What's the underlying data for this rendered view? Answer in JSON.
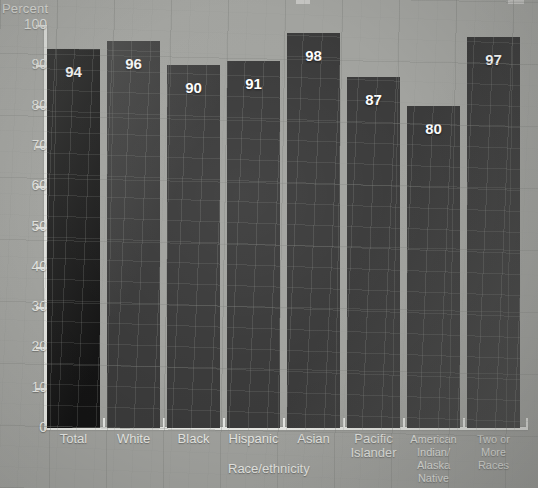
{
  "chart_data": {
    "type": "bar",
    "title": "",
    "xlabel": "Race/ethnicity",
    "ylabel": "Percent",
    "ylim": [
      0,
      100
    ],
    "ytick_labels": [
      "100",
      "90",
      "80",
      "70",
      "60",
      "50",
      "40",
      "30",
      "20",
      "10",
      "0"
    ],
    "ytick_values": [
      100,
      90,
      80,
      70,
      60,
      50,
      40,
      30,
      20,
      10,
      0
    ],
    "grid": false,
    "legend": "none",
    "categories": [
      "Total",
      "White",
      "Black",
      "Hispanic",
      "Asian",
      "Pacific Islander",
      "American Indian/ Alaska Native",
      "Two or More Races"
    ],
    "category_lines": [
      [
        "Total"
      ],
      [
        "White"
      ],
      [
        "Black"
      ],
      [
        "Hispanic"
      ],
      [
        "Asian"
      ],
      [
        "Pacific",
        "Islander"
      ],
      [
        "American",
        "Indian/",
        "Alaska",
        "Native"
      ],
      [
        "Two or",
        "More",
        "Races"
      ]
    ],
    "values": [
      94,
      96,
      90,
      91,
      98,
      87,
      80,
      97
    ],
    "value_labels": [
      "94",
      "96",
      "90",
      "91",
      "98",
      "87",
      "80",
      "97"
    ],
    "bar_colors": [
      "#141414",
      "#3b3b3b",
      "#3b3b3b",
      "#3b3b3b",
      "#3b3b3b",
      "#3b3b3b",
      "#3b3b3b",
      "#3b3b3b"
    ]
  },
  "colors": {
    "background": "#a2a39f",
    "axis": "#e9eae6",
    "text": "#e9eae6",
    "value_text": "#ffffff",
    "bar_total": "#141414",
    "bar_default": "#3b3b3b"
  }
}
